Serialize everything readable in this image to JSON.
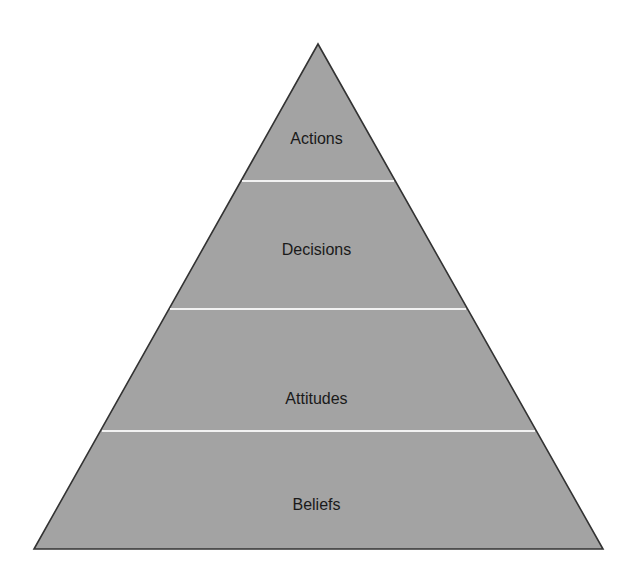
{
  "diagram": {
    "type": "pyramid",
    "colors": {
      "fill": "#a3a3a3",
      "outline": "#333333",
      "separator": "#f2f2f2",
      "label": "#1a1a1a",
      "background": "#ffffff"
    },
    "geometry": {
      "apex": [
        318,
        44
      ],
      "base_left": [
        34,
        549
      ],
      "base_right": [
        603,
        549
      ],
      "separator_y": [
        181,
        309,
        431
      ]
    },
    "tiers": [
      {
        "label": "Actions",
        "position": "top"
      },
      {
        "label": "Decisions",
        "position": "upper-middle"
      },
      {
        "label": "Attitudes",
        "position": "lower-middle"
      },
      {
        "label": "Beliefs",
        "position": "base"
      }
    ]
  }
}
